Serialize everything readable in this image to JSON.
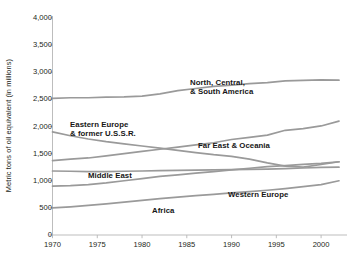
{
  "chart_data": {
    "type": "line",
    "title": "",
    "subtitle": "",
    "xlabel": "",
    "ylabel": "Metric tons of oil equivalent (in millions)",
    "xlim": [
      1970,
      2002
    ],
    "ylim": [
      0,
      4000
    ],
    "grid": false,
    "legend_position": "inline-labels",
    "x_ticks": [
      "1970",
      "1975",
      "1980",
      "1985",
      "1990",
      "1995",
      "2000"
    ],
    "x_tick_values": [
      1970,
      1975,
      1980,
      1985,
      1990,
      1995,
      2000
    ],
    "y_ticks": [
      "0",
      "500",
      "1,000",
      "1,500",
      "2,000",
      "2,500",
      "3,000",
      "3,500",
      "4,000"
    ],
    "y_tick_values": [
      0,
      500,
      1000,
      1500,
      2000,
      2500,
      3000,
      3500,
      4000
    ],
    "line_color": "#9a9a9a",
    "axis_color": "#b5b5b5",
    "x": [
      1970,
      1972,
      1974,
      1976,
      1978,
      1980,
      1982,
      1984,
      1986,
      1988,
      1990,
      1992,
      1994,
      1996,
      1998,
      2000,
      2002
    ],
    "series": [
      {
        "name": "North, Central, & South America",
        "label_lines": [
          "North, Central,",
          "& South America"
        ],
        "values": [
          2520,
          2530,
          2530,
          2540,
          2545,
          2560,
          2600,
          2660,
          2700,
          2740,
          2760,
          2790,
          2810,
          2840,
          2850,
          2860,
          2855
        ]
      },
      {
        "name": "Eastern Europe & former U.S.S.R.",
        "label_lines": [
          "Eastern Europe",
          "& former U.S.S.R."
        ],
        "values": [
          1900,
          1830,
          1770,
          1720,
          1680,
          1640,
          1600,
          1560,
          1520,
          1480,
          1450,
          1400,
          1330,
          1270,
          1250,
          1300,
          1350
        ]
      },
      {
        "name": "Far East & Oceania",
        "label_lines": [
          "Far East & Oceania"
        ],
        "values": [
          1370,
          1400,
          1420,
          1460,
          1500,
          1540,
          1580,
          1620,
          1660,
          1700,
          1760,
          1800,
          1840,
          1930,
          1960,
          2010,
          2100
        ]
      },
      {
        "name": "Middle East",
        "label_lines": [
          "Middle East"
        ],
        "values": [
          900,
          910,
          930,
          960,
          1000,
          1040,
          1080,
          1110,
          1140,
          1170,
          1200,
          1230,
          1260,
          1280,
          1300,
          1320,
          1350
        ]
      },
      {
        "name": "Western Europe",
        "label_lines": [
          "Western Europe"
        ],
        "values": [
          1180,
          1175,
          1170,
          1170,
          1175,
          1180,
          1185,
          1190,
          1195,
          1200,
          1205,
          1210,
          1215,
          1225,
          1235,
          1245,
          1250
        ]
      },
      {
        "name": "Africa",
        "label_lines": [
          "Africa"
        ],
        "values": [
          500,
          520,
          545,
          575,
          605,
          640,
          670,
          700,
          725,
          750,
          775,
          800,
          825,
          855,
          890,
          930,
          1000
        ]
      }
    ],
    "series_labels": [
      {
        "name": "North, Central, & South America",
        "lines": [
          "North, Central,",
          "& South America"
        ],
        "x_px": 190,
        "y_px": 78
      },
      {
        "name": "Eastern Europe & former U.S.S.R.",
        "lines": [
          "Eastern Europe",
          "& former U.S.S.R."
        ],
        "x_px": 70,
        "y_px": 120
      },
      {
        "name": "Far East & Oceania",
        "lines": [
          "Far East & Oceania"
        ],
        "x_px": 198,
        "y_px": 141
      },
      {
        "name": "Middle East",
        "lines": [
          "Middle East"
        ],
        "x_px": 88,
        "y_px": 171
      },
      {
        "name": "Western Europe",
        "lines": [
          "Western Europe"
        ],
        "x_px": 228,
        "y_px": 190
      },
      {
        "name": "Africa",
        "lines": [
          "Africa"
        ],
        "x_px": 152,
        "y_px": 206
      }
    ]
  }
}
